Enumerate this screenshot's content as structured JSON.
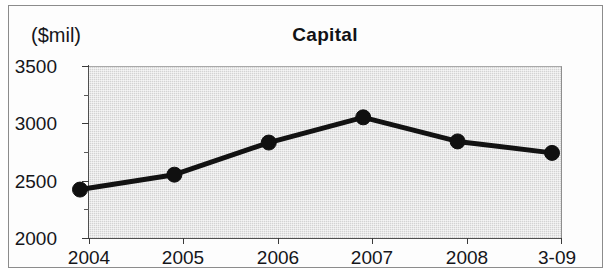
{
  "figure": {
    "unit_label": "($mil)",
    "title": "Capital"
  },
  "chart_data": {
    "type": "line",
    "title": "Capital",
    "subtitle": "",
    "xlabel": "",
    "ylabel": "($mil)",
    "units": "$mil",
    "categories": [
      "2004",
      "2005",
      "2006",
      "2007",
      "2008",
      "3-09"
    ],
    "values": [
      2370,
      2500,
      2780,
      3000,
      2790,
      2690
    ],
    "series": [
      {
        "name": "Capital",
        "values": [
          2370,
          2500,
          2780,
          3000,
          2790,
          2690
        ]
      }
    ],
    "ylim": [
      2000,
      3500
    ],
    "y_ticks": [
      "2000",
      "2500",
      "3000",
      "3500"
    ],
    "y_tick_values": [
      2000,
      2500,
      3000,
      3500
    ],
    "y_minor_tick_values": [
      2250,
      2750,
      3250
    ],
    "x_ticks": [
      "2004",
      "2005",
      "2006",
      "2007",
      "2008",
      "3-09"
    ],
    "grid": false,
    "legend": false,
    "legend_position": "none",
    "plot_background": "#d3d3d3",
    "line_color": "#121212",
    "marker_color": "#101010",
    "marker_shape": "circle",
    "annotations": []
  },
  "axis": {
    "y_labels": [
      "3500",
      "3000",
      "2500",
      "2000"
    ],
    "x_labels": [
      "2004",
      "2005",
      "2006",
      "2007",
      "2008",
      "3-09"
    ]
  }
}
